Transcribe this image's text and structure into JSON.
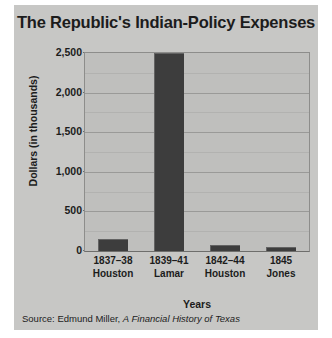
{
  "figure": {
    "title": "The Republic's Indian-Policy Expenses",
    "xlabel": "Years",
    "ylabel": "Dollars (in thousands)",
    "source_prefix": "Source: Edmund Miller, ",
    "source_book": "A Financial History of Texas",
    "colors": {
      "card_background": "#c7c7c5",
      "plot_background": "#bfbfbd",
      "bar": "#3d3d3d",
      "gridline": "#9a9a98",
      "text": "#1c1c1c"
    }
  },
  "chart_data": {
    "type": "bar",
    "title": "The Republic's Indian-Policy Expenses",
    "xlabel": "Years",
    "ylabel": "Dollars (in thousands)",
    "categories": [
      "1837–38 Houston",
      "1839–41 Lamar",
      "1842–44 Houston",
      "1845 Jones"
    ],
    "category_lines": [
      [
        "1837–38",
        "Houston"
      ],
      [
        "1839–41",
        "Lamar"
      ],
      [
        "1842–44",
        "Houston"
      ],
      [
        "1845",
        "Jones"
      ]
    ],
    "values": [
      150,
      2500,
      75,
      50
    ],
    "ylim": [
      0,
      2500
    ],
    "ytick_labels": [
      "0",
      "500",
      "1,000",
      "1,500",
      "2,000",
      "2,500"
    ],
    "ytick_values": [
      0,
      500,
      1000,
      1500,
      2000,
      2500
    ],
    "minor_gridline_values": [
      250,
      750,
      1250,
      1750,
      2250
    ],
    "grid": true,
    "legend": "none",
    "source": "Source: Edmund Miller, A Financial History of Texas"
  }
}
